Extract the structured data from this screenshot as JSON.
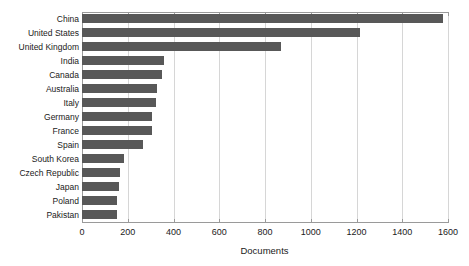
{
  "chart_data": {
    "type": "bar",
    "orientation": "horizontal",
    "title": "",
    "subtitle": "",
    "xlabel": "Documents",
    "ylabel": "",
    "categories": [
      "China",
      "United States",
      "United Kingdom",
      "India",
      "Canada",
      "Australia",
      "Italy",
      "Germany",
      "France",
      "Spain",
      "South Korea",
      "Czech Republic",
      "Japan",
      "Poland",
      "Pakistan"
    ],
    "values": [
      1580,
      1215,
      870,
      360,
      350,
      328,
      323,
      305,
      305,
      268,
      183,
      166,
      162,
      153,
      152
    ],
    "xlim": [
      0,
      1600
    ],
    "xticks": [
      0,
      200,
      400,
      600,
      800,
      1000,
      1200,
      1400,
      1600
    ],
    "xtick_labels": [
      "0",
      "200",
      "400",
      "600",
      "800",
      "1000",
      "1200",
      "1400",
      "1600"
    ],
    "grid": "vertical",
    "legend": null,
    "legend_position": "none",
    "series": [
      {
        "name": "Documents",
        "color": "#585858",
        "values": [
          1580,
          1215,
          870,
          360,
          350,
          328,
          323,
          305,
          305,
          268,
          183,
          166,
          162,
          153,
          152
        ]
      }
    ]
  },
  "colors": {
    "bar": "#585858",
    "gridline": "#d6d6d6",
    "axis": "#9a9a9a",
    "text": "#1a1a1a",
    "background": "#ffffff"
  }
}
